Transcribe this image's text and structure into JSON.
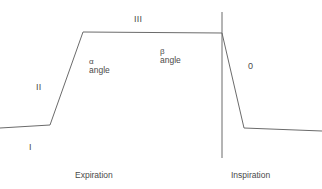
{
  "diagram": {
    "line_color": "#6b6b6b",
    "text_color": "#4a4a4a",
    "background": "#ffffff",
    "phases": {
      "phase_one": "I",
      "phase_two": "II",
      "phase_three": "III",
      "phase_zero": "0"
    },
    "angles": {
      "alpha_symbol": "α",
      "alpha_word": "angle",
      "beta_symbol": "β",
      "beta_word": "angle"
    },
    "axis_labels": {
      "expiration": "Expiration",
      "inspiration": "Inspiration"
    }
  },
  "chart_data": {
    "type": "line",
    "xlabel": "",
    "ylabel": "",
    "grid": false,
    "legend": "none",
    "series": [
      {
        "name": "capnogram-trace",
        "points": [
          [
            0,
            128
          ],
          [
            50,
            125
          ],
          [
            83,
            32
          ],
          [
            222,
            33
          ],
          [
            244,
            128
          ],
          [
            322,
            131
          ]
        ]
      },
      {
        "name": "expiration-inspiration-divider",
        "points": [
          [
            222,
            12
          ],
          [
            222,
            158
          ]
        ]
      }
    ],
    "annotations": [
      {
        "text": "I",
        "x": 31,
        "y": 150
      },
      {
        "text": "II",
        "x": 38,
        "y": 90
      },
      {
        "text": "III",
        "x": 137,
        "y": 22
      },
      {
        "text": "0",
        "x": 250,
        "y": 69
      },
      {
        "text": "α angle",
        "x": 90,
        "y": 62
      },
      {
        "text": "β angle",
        "x": 161,
        "y": 52
      },
      {
        "text": "Expiration",
        "x": 76,
        "y": 178
      },
      {
        "text": "Inspiration",
        "x": 232,
        "y": 178
      }
    ]
  }
}
